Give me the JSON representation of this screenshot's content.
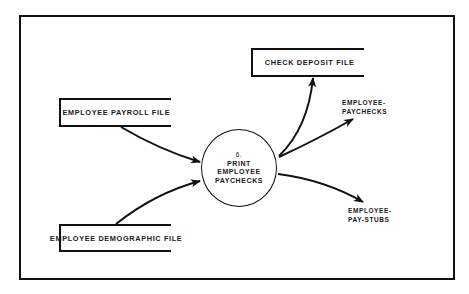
{
  "diagram": {
    "type": "data-flow-diagram",
    "process": {
      "number": "6.",
      "lines": [
        "PRINT",
        "EMPLOYEE",
        "PAYCHECKS"
      ]
    },
    "data_stores": [
      {
        "id": "payroll",
        "label": "EMPLOYEE PAYROLL FILE"
      },
      {
        "id": "demographic",
        "label": "EMPLOYEE DEMOGRAPHIC FILE"
      },
      {
        "id": "check_deposit",
        "label": "CHECK DEPOSIT FILE"
      }
    ],
    "outputs": [
      {
        "id": "paychecks",
        "lines": [
          "EMPLOYEE-",
          "PAYCHECKS"
        ]
      },
      {
        "id": "pay_stubs",
        "lines": [
          "EMPLOYEE-",
          "PAY-STUBS"
        ]
      }
    ],
    "flows": [
      {
        "from": "EMPLOYEE PAYROLL FILE",
        "to": "6. PRINT EMPLOYEE PAYCHECKS"
      },
      {
        "from": "EMPLOYEE DEMOGRAPHIC FILE",
        "to": "6. PRINT EMPLOYEE PAYCHECKS"
      },
      {
        "from": "6. PRINT EMPLOYEE PAYCHECKS",
        "to": "CHECK DEPOSIT FILE"
      },
      {
        "from": "6. PRINT EMPLOYEE PAYCHECKS",
        "to": "EMPLOYEE-PAYCHECKS"
      },
      {
        "from": "6. PRINT EMPLOYEE PAYCHECKS",
        "to": "EMPLOYEE-PAY-STUBS"
      }
    ],
    "colors": {
      "ink": "#111111",
      "background": "#ffffff"
    }
  }
}
